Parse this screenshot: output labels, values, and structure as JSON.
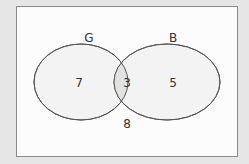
{
  "diagram": {
    "type": "venn",
    "sets": [
      {
        "name": "G",
        "label": "G",
        "only_value": "7"
      },
      {
        "name": "B",
        "label": "B",
        "only_value": "5"
      }
    ],
    "intersection_value": "3",
    "outside_value": "8",
    "colors": {
      "background": "#e6e6e6",
      "frame": "#fcfcfc",
      "ellipse_fill": "#f3f3f3",
      "intersection_fill": "#e2e2e2",
      "stroke": "#555555"
    }
  }
}
